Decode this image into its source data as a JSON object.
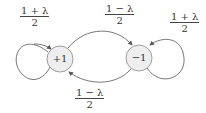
{
  "diagram": {
    "type": "markov-chain-state-diagram",
    "nodes": [
      {
        "id": "plus",
        "label": "+1",
        "fill": "#eeeeee",
        "stroke": "#888888"
      },
      {
        "id": "minus",
        "label": "−1",
        "fill": "#eeeeee",
        "stroke": "#888888"
      }
    ],
    "edges": [
      {
        "from": "plus",
        "to": "plus",
        "label_num": "1 + λ",
        "label_den": "2"
      },
      {
        "from": "plus",
        "to": "minus",
        "label_num": "1 − λ",
        "label_den": "2"
      },
      {
        "from": "minus",
        "to": "minus",
        "label_num": "1 + λ",
        "label_den": "2"
      },
      {
        "from": "minus",
        "to": "plus",
        "label_num": "1 − λ",
        "label_den": "2"
      }
    ]
  }
}
